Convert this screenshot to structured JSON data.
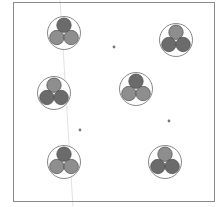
{
  "colors": {
    "background": "#ffffff",
    "frame": "#8a8a8a",
    "outer_ring": "#7a7a7a",
    "dark_fill": "#6b6b6b",
    "light_fill": "#8e8e8e",
    "circle_stroke": "#4a4a4a",
    "dot": "#777777",
    "guide_line": "#e2e2e2"
  },
  "frame": {
    "x": 13,
    "y": 2,
    "width": 201,
    "height": 199
  },
  "guide_line": {
    "x1": 60,
    "y1": 0,
    "x2": 73,
    "y2": 207
  },
  "clusters": [
    {
      "cx": 64,
      "cy": 33,
      "top": "dark",
      "bottom": "light"
    },
    {
      "cx": 176,
      "cy": 40,
      "top": "light",
      "bottom": "dark"
    },
    {
      "cx": 54,
      "cy": 93,
      "top": "light",
      "bottom": "dark"
    },
    {
      "cx": 136,
      "cy": 89,
      "top": "dark",
      "bottom": "light"
    },
    {
      "cx": 64,
      "cy": 162,
      "top": "dark",
      "bottom": "light"
    },
    {
      "cx": 165,
      "cy": 162,
      "top": "light",
      "bottom": "dark"
    }
  ],
  "cluster_geometry": {
    "outer_r": 16.5,
    "inner_r": 7.2,
    "offset": 8.2
  },
  "dots": [
    {
      "x": 114,
      "y": 47
    },
    {
      "x": 80,
      "y": 130
    },
    {
      "x": 169,
      "y": 121
    }
  ]
}
